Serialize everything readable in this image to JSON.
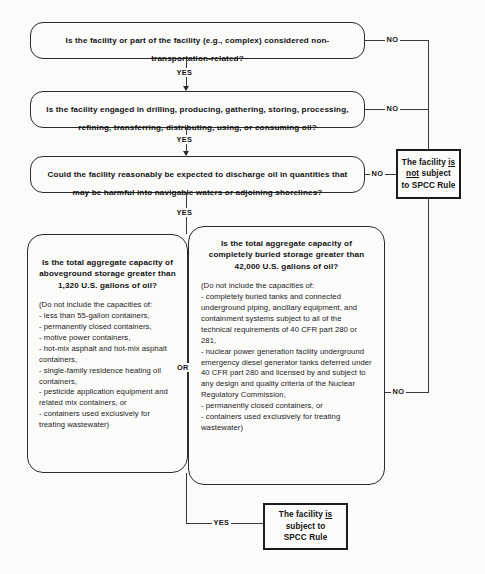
{
  "diagram": {
    "labels": {
      "yes": "YES",
      "no": "NO",
      "or": "OR"
    },
    "colors": {
      "background": "#fbfbfa",
      "line": "#3a3a3a",
      "text": "#111111"
    }
  },
  "nodes": {
    "q1": {
      "question": "Is the facility or part of the facility (e.g., complex) considered non-transportation-related?"
    },
    "q2": {
      "question": "Is the facility engaged in drilling, producing, gathering, storing, processing, refining, transferring, distributing, using, or consuming oil?"
    },
    "q3": {
      "question": "Could the facility reasonably be expected to discharge oil in quantities that may be harmful into navigable waters or adjoining shorelines?"
    },
    "q4_aboveground": {
      "question": "Is the total aggregate capacity of aboveground storage greater than 1,320 U.S. gallons of oil?",
      "note": "(Do not include the capacities of:\n- less than 55-gallon containers,\n- permanently closed containers,\n- motive power containers,\n- hot-mix asphalt and hot-mix asphalt containers,\n- single-family residence heating oil containers,\n- pesticide application equipment and related mix containers, or\n- containers used exclusively for treating wastewater)"
    },
    "q5_buried": {
      "question": "Is the total aggregate capacity of completely buried storage greater than 42,000 U.S. gallons of oil?",
      "note": "(Do not include the capacities of:\n- completely buried tanks and connected underground piping, ancillary equipment, and containment systems subject to all of the technical requirements of 40 CFR part 280 or 281,\n- nuclear power generation facility underground emergency diesel generator tanks deferred under 40 CFR part 280 and licensed by and subject to any design and quality criteria of the Nuclear Regulatory Commission,\n- permanently closed containers, or\n- containers used exclusively for treating wastewater)"
    },
    "result_not_subject": {
      "line1_pre": "The facility ",
      "line1_em": "is",
      "line2_em": "not",
      "line2_post": " subject",
      "line3": "to SPCC Rule"
    },
    "result_subject": {
      "line1_pre": "The facility ",
      "line1_em": "is",
      "line2": "subject to",
      "line3": "SPCC Rule"
    }
  },
  "edges": [
    {
      "from": "q1",
      "to": "q2",
      "label": "YES"
    },
    {
      "from": "q1",
      "to": "result_not_subject",
      "label": "NO"
    },
    {
      "from": "q2",
      "to": "q3",
      "label": "YES"
    },
    {
      "from": "q2",
      "to": "result_not_subject",
      "label": "NO"
    },
    {
      "from": "q3",
      "to": "q4_aboveground",
      "label": "YES"
    },
    {
      "from": "q3",
      "to": "result_not_subject",
      "label": "NO"
    },
    {
      "from": "q4_aboveground",
      "to": "result_subject",
      "label": "YES"
    },
    {
      "from": "q5_buried",
      "to": "result_not_subject",
      "label": "NO"
    },
    {
      "from": "q4_aboveground",
      "to": "q5_buried",
      "label": "OR"
    }
  ]
}
